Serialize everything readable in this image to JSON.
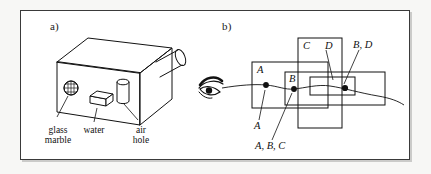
{
  "figure": {
    "panels": [
      {
        "id": "a",
        "letter": "a)",
        "caption_parts": [
          "glass\nmarble",
          "water",
          "air\nhole"
        ],
        "objects": [
          {
            "name": "glass-marble",
            "label": "glass marble",
            "shape": "stippled-sphere"
          },
          {
            "name": "water",
            "label": "water",
            "shape": "small-parallelepiped"
          },
          {
            "name": "air-hole",
            "label": "air hole",
            "shape": "cylinder"
          },
          {
            "name": "box",
            "label": "box",
            "shape": "3d-box"
          },
          {
            "name": "tube",
            "label": "tube",
            "shape": "oblique-cylinder"
          }
        ]
      },
      {
        "id": "b",
        "letter": "b)",
        "box_labels": [
          "A",
          "B",
          "C",
          "D"
        ],
        "point_labels": [
          "A",
          "A, B, C",
          "B, D"
        ],
        "eye": "eye-icon",
        "ray": "curved-ray"
      }
    ]
  },
  "panel_a": {
    "letter": "a)",
    "label_glass_marble_line1": "glass",
    "label_glass_marble_line2": "marble",
    "label_water": "water",
    "label_air_line1": "air",
    "label_air_line2": "hole"
  },
  "panel_b": {
    "letter": "b)",
    "rect_label_A": "A",
    "rect_label_B": "B",
    "rect_label_C": "C",
    "rect_label_D": "D",
    "point_label_A": "A",
    "point_label_ABC": "A, B, C",
    "point_label_BD": "B, D"
  },
  "colors": {
    "ink": "#111111",
    "frame": "#3a3a3a",
    "paper": "#ffffff",
    "page": "#f7f7f5"
  }
}
